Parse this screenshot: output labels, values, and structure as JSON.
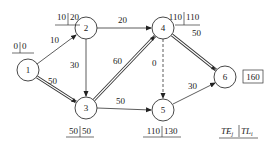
{
  "diagram": {
    "type": "activity-network",
    "nodes": [
      {
        "id": "1",
        "label": "1",
        "x": 28,
        "y": 70,
        "te": "0",
        "tl": "0"
      },
      {
        "id": "2",
        "label": "2",
        "x": 86,
        "y": 28,
        "te": "10",
        "tl": "20"
      },
      {
        "id": "3",
        "label": "3",
        "x": 86,
        "y": 108,
        "te": "50",
        "tl": "50"
      },
      {
        "id": "4",
        "label": "4",
        "x": 163,
        "y": 28,
        "te": "110",
        "tl": "110"
      },
      {
        "id": "5",
        "label": "5",
        "x": 163,
        "y": 110,
        "te": "110",
        "tl": "130"
      },
      {
        "id": "6",
        "label": "6",
        "x": 225,
        "y": 77,
        "end_time": "160"
      }
    ],
    "edges": [
      {
        "from": "1",
        "to": "2",
        "duration": "10",
        "critical": false,
        "dummy": false
      },
      {
        "from": "1",
        "to": "3",
        "duration": "50",
        "critical": true,
        "dummy": false
      },
      {
        "from": "2",
        "to": "4",
        "duration": "20",
        "critical": false,
        "dummy": false
      },
      {
        "from": "2",
        "to": "3",
        "duration": "30",
        "critical": false,
        "dummy": false
      },
      {
        "from": "3",
        "to": "4",
        "duration": "60",
        "critical": true,
        "dummy": false
      },
      {
        "from": "3",
        "to": "5",
        "duration": "50",
        "critical": false,
        "dummy": false
      },
      {
        "from": "4",
        "to": "5",
        "duration": "0",
        "critical": false,
        "dummy": true
      },
      {
        "from": "4",
        "to": "6",
        "duration": "50",
        "critical": true,
        "dummy": false
      },
      {
        "from": "5",
        "to": "6",
        "duration": "30",
        "critical": false,
        "dummy": false
      }
    ],
    "legend": {
      "te": "TE",
      "te_sub": "j",
      "tl": "TL",
      "tl_sub": "i"
    }
  }
}
